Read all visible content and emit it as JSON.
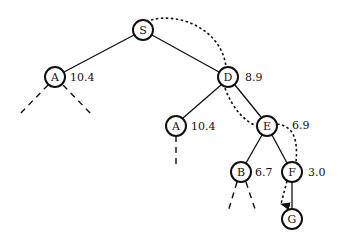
{
  "diagram": {
    "type": "search-tree",
    "nodes": [
      {
        "id": "S",
        "label": "S",
        "value": "",
        "x": 143,
        "y": 30
      },
      {
        "id": "A1",
        "label": "A",
        "value": "10.4",
        "x": 55,
        "y": 77
      },
      {
        "id": "D",
        "label": "D",
        "value": "8.9",
        "x": 228,
        "y": 77
      },
      {
        "id": "A2",
        "label": "A",
        "value": "10.4",
        "x": 176,
        "y": 126
      },
      {
        "id": "E",
        "label": "E",
        "value": "6.9",
        "x": 267,
        "y": 126
      },
      {
        "id": "B",
        "label": "B",
        "value": "6.7",
        "x": 241,
        "y": 172
      },
      {
        "id": "F",
        "label": "F",
        "value": "3.0",
        "x": 292,
        "y": 172
      },
      {
        "id": "G",
        "label": "G",
        "value": "",
        "x": 292,
        "y": 219
      }
    ],
    "edges": [
      {
        "from": "S",
        "to": "A1"
      },
      {
        "from": "S",
        "to": "D"
      },
      {
        "from": "D",
        "to": "A2"
      },
      {
        "from": "D",
        "to": "E"
      },
      {
        "from": "E",
        "to": "B"
      },
      {
        "from": "E",
        "to": "F"
      },
      {
        "from": "F",
        "to": "G"
      }
    ],
    "unexpanded_branches": [
      {
        "from": "A1",
        "direction": "left"
      },
      {
        "from": "A1",
        "direction": "right"
      },
      {
        "from": "A2",
        "direction": "down"
      },
      {
        "from": "B",
        "direction": "left"
      },
      {
        "from": "B",
        "direction": "right"
      }
    ],
    "search_path": [
      "S",
      "D",
      "E",
      "F",
      "G"
    ]
  }
}
